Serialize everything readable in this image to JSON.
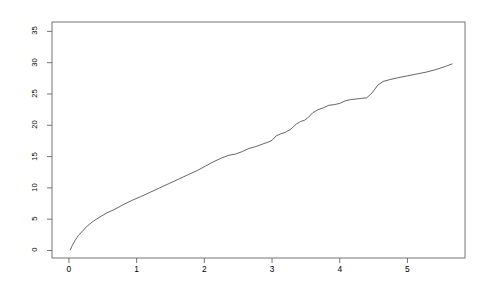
{
  "chart_data": {
    "type": "line",
    "title": "QQ-plot of the bootstrap distribution of model test statistics and the theoretical Fisher distribution",
    "xlabel": "Theoretical Fisher quantiles",
    "ylabel": "Bootstrap distribution quantiles of the model statistic",
    "xlim": [
      -0.25,
      5.85
    ],
    "ylim": [
      -1.2,
      36.5
    ],
    "xticks": [
      0,
      1,
      2,
      3,
      4,
      5
    ],
    "xtick_labels": [
      "0",
      "1",
      "2",
      "3",
      "4",
      "5"
    ],
    "yticks": [
      0,
      5,
      10,
      15,
      20,
      25,
      30,
      35
    ],
    "ytick_labels": [
      "0",
      "5",
      "10",
      "15",
      "20",
      "25",
      "30",
      "35"
    ],
    "grid": false,
    "legend": false,
    "line_color": "#555555",
    "frame_color": "#666666",
    "background": "#ffffff",
    "series": [
      {
        "name": "bootstrap vs theoretical quantiles",
        "x": [
          0.02,
          0.05,
          0.09,
          0.14,
          0.2,
          0.27,
          0.35,
          0.45,
          0.56,
          0.68,
          0.8,
          0.93,
          1.06,
          1.2,
          1.34,
          1.48,
          1.62,
          1.76,
          1.9,
          2.02,
          2.14,
          2.26,
          2.36,
          2.46,
          2.56,
          2.66,
          2.76,
          2.86,
          2.94,
          3.0,
          3.06,
          3.12,
          3.2,
          3.28,
          3.36,
          3.42,
          3.48,
          3.54,
          3.6,
          3.68,
          3.76,
          3.84,
          3.92,
          4.0,
          4.08,
          4.16,
          4.24,
          4.32,
          4.4,
          4.48,
          4.56,
          4.64,
          4.74,
          4.86,
          5.0,
          5.14,
          5.28,
          5.42,
          5.56,
          5.66
        ],
        "y": [
          0.1,
          0.8,
          1.6,
          2.4,
          3.1,
          3.9,
          4.6,
          5.3,
          6.0,
          6.6,
          7.3,
          8.0,
          8.6,
          9.3,
          10.0,
          10.7,
          11.4,
          12.1,
          12.8,
          13.5,
          14.2,
          14.8,
          15.2,
          15.4,
          15.8,
          16.3,
          16.6,
          17.0,
          17.3,
          17.6,
          18.3,
          18.6,
          18.9,
          19.4,
          20.2,
          20.6,
          20.8,
          21.3,
          22.0,
          22.5,
          22.8,
          23.2,
          23.3,
          23.5,
          23.9,
          24.1,
          24.2,
          24.3,
          24.4,
          25.2,
          26.4,
          27.0,
          27.3,
          27.6,
          27.9,
          28.2,
          28.5,
          28.9,
          29.4,
          29.8
        ]
      }
    ]
  }
}
